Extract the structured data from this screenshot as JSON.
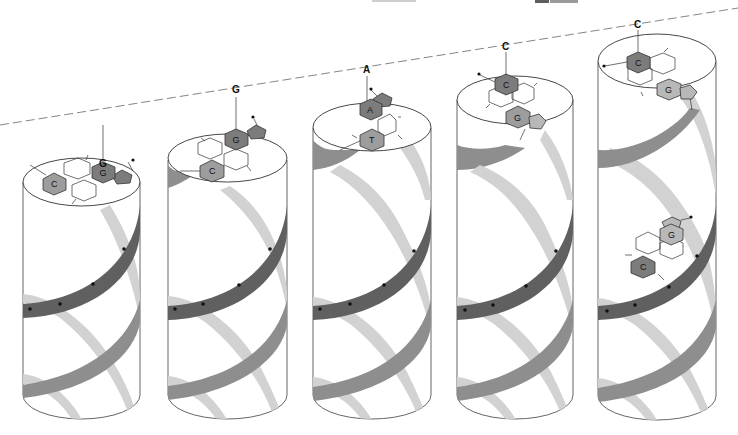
{
  "figure": {
    "header_fragment": "",
    "axis_line": "dashed-sequence-axis"
  },
  "colors": {
    "background": "#ffffff",
    "backbone_dark": "#606060",
    "backbone_mid": "#8e8e8e",
    "backbone_light": "#d2d2d2",
    "base_dark": "#7c7c7c",
    "base_mid": "#9d9d9d",
    "base_light": "#b8b8b8",
    "outline": "#333333"
  },
  "sequence_labels": [
    "G",
    "G",
    "A",
    "C",
    "C"
  ],
  "cylinders": [
    {
      "index": 1,
      "sequence_label": "G",
      "top_pair": {
        "upper_base": "G",
        "lower_base": "C",
        "upper_shade": "dark",
        "lower_shade": "mid"
      }
    },
    {
      "index": 2,
      "sequence_label": "G",
      "top_pair": {
        "upper_base": "G",
        "lower_base": "C",
        "upper_shade": "dark",
        "lower_shade": "mid"
      }
    },
    {
      "index": 3,
      "sequence_label": "A",
      "top_pair": {
        "upper_base": "A",
        "lower_base": "T",
        "upper_shade": "dark",
        "lower_shade": "mid"
      }
    },
    {
      "index": 4,
      "sequence_label": "C",
      "top_pair": {
        "upper_base": "C",
        "lower_base": "G",
        "upper_shade": "dark",
        "lower_shade": "mid"
      }
    },
    {
      "index": 5,
      "sequence_label": "C",
      "top_pair": {
        "upper_base": "C",
        "lower_base": "G",
        "upper_shade": "dark",
        "lower_shade": "light"
      },
      "inner_pair": {
        "upper_base": "G",
        "lower_base": "C",
        "upper_shade": "light",
        "lower_shade": "dark"
      }
    }
  ]
}
